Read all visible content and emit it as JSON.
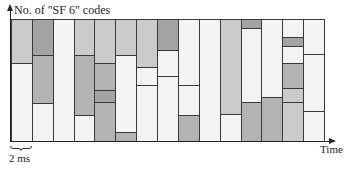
{
  "labels": {
    "y_axis": "No. of \"SF 6\" codes",
    "x_axis": "Time",
    "scale_bar": "2 ms"
  },
  "colors": {
    "white": "#f4f4f4",
    "light": "#cbcbcb",
    "mid": "#b3b3b3",
    "dark": "#a3a3a3",
    "border": "#3a3a3a"
  },
  "chart_data": {
    "type": "stacked-segments",
    "title": "",
    "ylabel": "No. of \"SF 6\" codes",
    "xlabel": "Time",
    "slot_width": "2 ms",
    "frame_px": {
      "top": 19,
      "bottom": 141,
      "left": 11,
      "right": 324
    },
    "columns": [
      {
        "index": 1,
        "segments": [
          {
            "from": 19,
            "to": 63,
            "shade": "light"
          },
          {
            "from": 63,
            "to": 141,
            "shade": "white"
          }
        ]
      },
      {
        "index": 2,
        "segments": [
          {
            "from": 19,
            "to": 55,
            "shade": "dark"
          },
          {
            "from": 55,
            "to": 103,
            "shade": "mid"
          },
          {
            "from": 103,
            "to": 141,
            "shade": "white"
          }
        ]
      },
      {
        "index": 3,
        "segments": [
          {
            "from": 19,
            "to": 141,
            "shade": "white"
          }
        ]
      },
      {
        "index": 4,
        "segments": [
          {
            "from": 19,
            "to": 55,
            "shade": "light"
          },
          {
            "from": 55,
            "to": 115,
            "shade": "mid"
          },
          {
            "from": 115,
            "to": 141,
            "shade": "white"
          }
        ]
      },
      {
        "index": 5,
        "segments": [
          {
            "from": 19,
            "to": 63,
            "shade": "light"
          },
          {
            "from": 63,
            "to": 90,
            "shade": "mid"
          },
          {
            "from": 90,
            "to": 102,
            "shade": "dark"
          },
          {
            "from": 102,
            "to": 141,
            "shade": "mid"
          }
        ]
      },
      {
        "index": 6,
        "segments": [
          {
            "from": 19,
            "to": 55,
            "shade": "light"
          },
          {
            "from": 55,
            "to": 132,
            "shade": "white"
          },
          {
            "from": 132,
            "to": 141,
            "shade": "mid"
          }
        ]
      },
      {
        "index": 7,
        "segments": [
          {
            "from": 19,
            "to": 67,
            "shade": "light"
          },
          {
            "from": 67,
            "to": 85,
            "shade": "white"
          },
          {
            "from": 85,
            "to": 141,
            "shade": "white"
          }
        ]
      },
      {
        "index": 8,
        "segments": [
          {
            "from": 19,
            "to": 50,
            "shade": "dark"
          },
          {
            "from": 50,
            "to": 76,
            "shade": "white"
          },
          {
            "from": 76,
            "to": 141,
            "shade": "white"
          }
        ]
      },
      {
        "index": 9,
        "segments": [
          {
            "from": 19,
            "to": 85,
            "shade": "white"
          },
          {
            "from": 85,
            "to": 115,
            "shade": "white"
          },
          {
            "from": 115,
            "to": 141,
            "shade": "mid"
          }
        ]
      },
      {
        "index": 10,
        "segments": [
          {
            "from": 19,
            "to": 141,
            "shade": "white"
          }
        ]
      },
      {
        "index": 11,
        "segments": [
          {
            "from": 19,
            "to": 114,
            "shade": "light"
          },
          {
            "from": 114,
            "to": 141,
            "shade": "white"
          }
        ]
      },
      {
        "index": 12,
        "segments": [
          {
            "from": 19,
            "to": 28,
            "shade": "dark"
          },
          {
            "from": 28,
            "to": 102,
            "shade": "white"
          },
          {
            "from": 102,
            "to": 141,
            "shade": "mid"
          }
        ]
      },
      {
        "index": 13,
        "segments": [
          {
            "from": 19,
            "to": 97,
            "shade": "white"
          },
          {
            "from": 97,
            "to": 141,
            "shade": "mid"
          }
        ]
      },
      {
        "index": 14,
        "segments": [
          {
            "from": 19,
            "to": 37,
            "shade": "white"
          },
          {
            "from": 37,
            "to": 46,
            "shade": "dark"
          },
          {
            "from": 46,
            "to": 63,
            "shade": "white"
          },
          {
            "from": 63,
            "to": 88,
            "shade": "mid"
          },
          {
            "from": 88,
            "to": 102,
            "shade": "light"
          },
          {
            "from": 102,
            "to": 141,
            "shade": "light"
          }
        ]
      },
      {
        "index": 15,
        "segments": [
          {
            "from": 19,
            "to": 54,
            "shade": "white"
          },
          {
            "from": 54,
            "to": 111,
            "shade": "white"
          },
          {
            "from": 111,
            "to": 141,
            "shade": "white"
          }
        ]
      }
    ],
    "grid": false,
    "legend": null
  }
}
